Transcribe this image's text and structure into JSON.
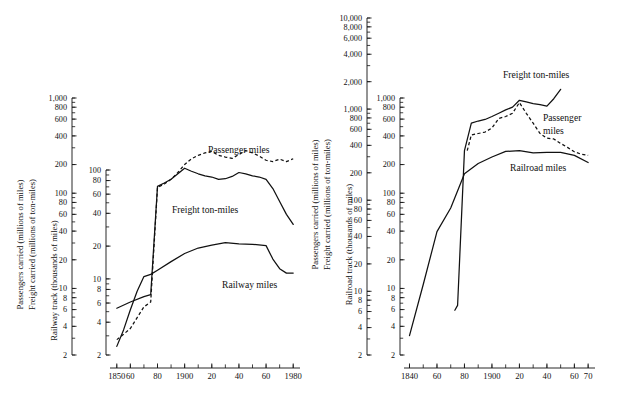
{
  "figure": {
    "background": "#ffffff",
    "ink": "#111111",
    "panels": [
      "left",
      "right"
    ]
  },
  "chart_data": [
    {
      "id": "left-chart",
      "type": "line",
      "title": "",
      "scale": "log",
      "xlabel": "",
      "xlim": [
        1845,
        1985
      ],
      "xticklabels": [
        "1850",
        "60",
        "80",
        "1900",
        "20",
        "40",
        "60",
        "1980"
      ],
      "xtickvalues": [
        1850,
        1860,
        1880,
        1900,
        1920,
        1940,
        1960,
        1980
      ],
      "xminorstep": 10,
      "axes": [
        {
          "name": "outer-left-axis",
          "title_lines": [
            "Passengers carried  (millions of miles)",
            "Freight carried  (millions of ton-miles)"
          ],
          "ylim": [
            2,
            1000
          ],
          "yticklabels": [
            "1,000",
            "800",
            "600",
            "400",
            "200",
            "100",
            "80",
            "60",
            "40",
            "20",
            "10",
            "8",
            "6",
            "4",
            "2"
          ],
          "ytickvalues": [
            1000,
            800,
            600,
            400,
            200,
            100,
            80,
            60,
            40,
            20,
            10,
            8,
            6,
            4,
            2
          ]
        },
        {
          "name": "inner-left-axis",
          "title_lines": [
            "Railway track  (thousands of miles)"
          ],
          "ylim": [
            2,
            100
          ],
          "yticklabels": [
            "100",
            "80",
            "60",
            "40",
            "20",
            "10",
            "8",
            "6",
            "4",
            "2"
          ],
          "ytickvalues": [
            100,
            80,
            60,
            40,
            20,
            10,
            8,
            6,
            4,
            2
          ]
        }
      ],
      "series": [
        {
          "name": "Passenger miles",
          "label": "Passenger miles",
          "style": "dashed",
          "axis": "outer-left-axis",
          "x": [
            1850,
            1855,
            1860,
            1870,
            1875,
            1880,
            1885,
            1890,
            1895,
            1900,
            1905,
            1910,
            1915,
            1920,
            1925,
            1930,
            1935,
            1940,
            1945,
            1950,
            1955,
            1960,
            1965,
            1970,
            1975,
            1980
          ],
          "y": [
            2.9,
            3.3,
            3.8,
            6.4,
            7.2,
            115,
            125,
            140,
            165,
            200,
            230,
            250,
            265,
            275,
            250,
            240,
            232,
            255,
            280,
            265,
            245,
            222,
            215,
            228,
            215,
            230
          ]
        },
        {
          "name": "Freight ton-miles",
          "label": "Freight ton-miles",
          "style": "solid",
          "axis": "outer-left-axis",
          "x": [
            1850,
            1860,
            1870,
            1875,
            1880,
            1885,
            1890,
            1895,
            1900,
            1905,
            1910,
            1915,
            1920,
            1925,
            1930,
            1935,
            1940,
            1945,
            1950,
            1955,
            1960,
            1965,
            1970,
            1975,
            1980
          ],
          "y": [
            6.2,
            7.2,
            8.2,
            8.6,
            118,
            128,
            140,
            160,
            183,
            170,
            160,
            152,
            148,
            140,
            142,
            150,
            165,
            160,
            152,
            148,
            140,
            112,
            82,
            60,
            47
          ]
        },
        {
          "name": "Railway miles",
          "label": "Railway miles",
          "style": "solid",
          "axis": "inner-left-axis",
          "x": [
            1850,
            1855,
            1860,
            1865,
            1870,
            1875,
            1880,
            1890,
            1900,
            1910,
            1920,
            1930,
            1940,
            1950,
            1960,
            1965,
            1970,
            1975,
            1980
          ],
          "y": [
            2.4,
            3.4,
            5.2,
            7.7,
            10.5,
            11.0,
            12.0,
            14.4,
            17.1,
            19.2,
            20.4,
            21.5,
            21.0,
            20.8,
            20.2,
            15.2,
            12.4,
            11.3,
            11.3
          ]
        }
      ]
    },
    {
      "id": "right-chart",
      "type": "line",
      "title": "",
      "scale": "log",
      "xlabel": "",
      "xlim": [
        1836,
        1975
      ],
      "xticklabels": [
        "1840",
        "60",
        "80",
        "1900",
        "20",
        "40",
        "60",
        "70"
      ],
      "xtickvalues": [
        1840,
        1860,
        1880,
        1900,
        1920,
        1940,
        1960,
        1970
      ],
      "xminorstep": 10,
      "axes": [
        {
          "name": "outer-right-axis",
          "title_lines": [
            "Passengers carried  (millions of miles)",
            "Freight carried  (millions of ton-miles)"
          ],
          "ylim": [
            2,
            10000
          ],
          "yticklabels": [
            "10,000",
            "8,000",
            "6,000",
            "4,000",
            "2,000",
            "1,000",
            "800",
            "600",
            "400",
            "200",
            "100",
            "80",
            "60",
            "40",
            "20",
            "10",
            "8",
            "6",
            "4",
            "2"
          ],
          "ytickvalues": [
            10000,
            8000,
            6000,
            4000,
            2000,
            1000,
            800,
            600,
            400,
            200,
            100,
            80,
            60,
            40,
            20,
            10,
            8,
            6,
            4,
            2
          ]
        },
        {
          "name": "inner-right-axis",
          "title_lines": [
            "Railroad track  (thousands of miles)"
          ],
          "ylim": [
            2,
            1000
          ],
          "yticklabels": [
            "1,000",
            "800",
            "600",
            "400",
            "200",
            "100",
            "80",
            "60",
            "40",
            "20",
            "10",
            "8",
            "6",
            "4",
            "2"
          ],
          "ytickvalues": [
            1000,
            800,
            600,
            400,
            200,
            100,
            80,
            60,
            40,
            20,
            10,
            8,
            6,
            4,
            2
          ]
        }
      ],
      "series": [
        {
          "name": "Passenger miles",
          "label": "Passenger miles",
          "label_lines": [
            "Passenger",
            "miles"
          ],
          "style": "dashed",
          "axis": "outer-right-axis",
          "x": [
            1882,
            1885,
            1890,
            1895,
            1900,
            1905,
            1910,
            1915,
            1920,
            1925,
            1930,
            1935,
            1940,
            1945,
            1950,
            1955,
            1960,
            1965,
            1970
          ],
          "y": [
            350,
            520,
            540,
            560,
            620,
            790,
            830,
            900,
            1180,
            900,
            700,
            540,
            480,
            470,
            420,
            380,
            340,
            320,
            310
          ]
        },
        {
          "name": "Freight ton-miles",
          "label": "Freight ton-miles",
          "style": "solid",
          "axis": "outer-right-axis",
          "x": [
            1873,
            1875,
            1880,
            1885,
            1890,
            1895,
            1900,
            1905,
            1910,
            1915,
            1920,
            1925,
            1930,
            1935,
            1940,
            1945,
            1950
          ],
          "y": [
            6.2,
            7.0,
            350,
            700,
            740,
            770,
            830,
            900,
            980,
            1050,
            1250,
            1200,
            1150,
            1120,
            1080,
            1300,
            1650
          ]
        },
        {
          "name": "Railroad miles",
          "label": "Railroad miles",
          "style": "solid",
          "axis": "inner-right-axis",
          "x": [
            1840,
            1850,
            1860,
            1870,
            1880,
            1890,
            1900,
            1910,
            1920,
            1930,
            1940,
            1950,
            1960,
            1970
          ],
          "y": [
            3.2,
            11.0,
            39.5,
            70.0,
            160,
            205,
            240,
            275,
            280,
            265,
            268,
            268,
            250,
            210
          ]
        }
      ]
    }
  ]
}
